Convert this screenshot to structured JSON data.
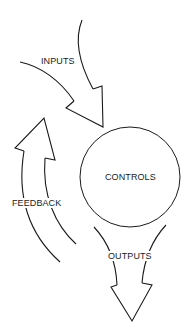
{
  "diagram": {
    "nodes": [
      {
        "id": "controls",
        "label": "CONTROLS",
        "shape": "circle"
      }
    ],
    "arrows": [
      {
        "id": "inputs",
        "label": "INPUTS",
        "direction": "into controls from upper-left"
      },
      {
        "id": "outputs",
        "label": "OUTPUTS",
        "direction": "out of controls downward"
      },
      {
        "id": "feedback",
        "label": "FEEDBACK",
        "direction": "upward on left, looping back to inputs"
      }
    ],
    "colors": {
      "stroke": "#1a1a1a",
      "background": "#ffffff"
    }
  }
}
